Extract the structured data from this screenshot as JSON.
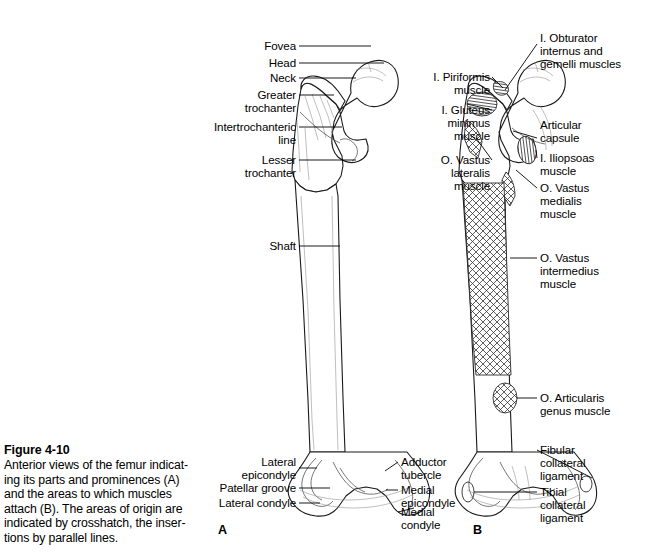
{
  "figure": {
    "number": "Figure 4-10",
    "caption_lines": [
      "Anterior views of the femur indicat-",
      "ing its parts and prominences (A)",
      "and the areas to which muscles",
      "attach (B). The areas of origin are",
      "indicated by crosshatch, the inser-",
      "tions by parallel lines."
    ],
    "caption_full": "Anterior views of the femur indicating its parts and prominences (A) and the areas to which muscles attach (B). The areas of origin are indicated by crosshatch, the insertions by parallel lines.",
    "panel_a_letter": "A",
    "panel_b_letter": "B",
    "subject": "femur",
    "view": "anterior"
  },
  "panel_a": {
    "title": "Anterior view of the femur — parts and prominences",
    "labels": [
      {
        "id": "fovea",
        "text": "Fovea",
        "side": "left"
      },
      {
        "id": "head",
        "text": "Head",
        "side": "left"
      },
      {
        "id": "neck",
        "text": "Neck",
        "side": "left"
      },
      {
        "id": "greater-trochanter",
        "text": "Greater\ntrochanter",
        "side": "left"
      },
      {
        "id": "intertrochanteric-line",
        "text": "Intertrochanteric\nline",
        "side": "left"
      },
      {
        "id": "lesser-trochanter",
        "text": "Lesser\ntrochanter",
        "side": "left"
      },
      {
        "id": "shaft",
        "text": "Shaft",
        "side": "left"
      },
      {
        "id": "lateral-epicondyle",
        "text": "Lateral\nepicondyle",
        "side": "left"
      },
      {
        "id": "patellar-groove",
        "text": "Patellar groove",
        "side": "left"
      },
      {
        "id": "lateral-condyle",
        "text": "Lateral condyle",
        "side": "left"
      },
      {
        "id": "adductor-tubercle",
        "text": "Adductor\ntubercle",
        "side": "right"
      },
      {
        "id": "medial-epicondyle",
        "text": "Medial\nepicondyle",
        "side": "right"
      },
      {
        "id": "medial-condyle",
        "text": "Medial\ncondyle",
        "side": "right"
      }
    ]
  },
  "panel_b": {
    "title": "Anterior view of the femur — muscle attachment areas",
    "legend": {
      "origin_marker": "crosshatch",
      "insertion_marker": "parallel lines",
      "origin_prefix": "O.",
      "insertion_prefix": "I."
    },
    "labels": [
      {
        "id": "obturator-internus-gemelli",
        "text": "I. Obturator\ninternus and\ngemelli muscles",
        "side": "right",
        "attachment": "insertion"
      },
      {
        "id": "piriformis",
        "text": "I. Piriformis\nmuscle",
        "side": "left",
        "attachment": "insertion"
      },
      {
        "id": "gluteus-minimus",
        "text": "I. Gluteus\nminimus\nmuscle",
        "side": "left",
        "attachment": "insertion"
      },
      {
        "id": "vastus-lateralis",
        "text": "O. Vastus\nlateralis\nmuscle",
        "side": "left",
        "attachment": "origin"
      },
      {
        "id": "articular-capsule",
        "text": "Articular\ncapsule",
        "side": "right",
        "attachment": "none"
      },
      {
        "id": "iliopsoas",
        "text": "I. Iliopsoas\nmuscle",
        "side": "right",
        "attachment": "insertion"
      },
      {
        "id": "vastus-medialis",
        "text": "O. Vastus\nmedialis\nmuscle",
        "side": "right",
        "attachment": "origin"
      },
      {
        "id": "vastus-intermedius",
        "text": "O. Vastus\nintermedius\nmuscle",
        "side": "right",
        "attachment": "origin"
      },
      {
        "id": "articularis-genus",
        "text": "O. Articularis\ngenus muscle",
        "side": "right",
        "attachment": "origin"
      },
      {
        "id": "fibular-collateral",
        "text": "Fibular\ncollateral\nligament",
        "side": "right",
        "attachment": "ligament"
      },
      {
        "id": "tibial-collateral",
        "text": "Tibial\ncollateral\nligament",
        "side": "right",
        "attachment": "ligament"
      }
    ]
  },
  "colors": {
    "background": "#ffffff",
    "ink": "#000000",
    "outline": "#1a1a1a",
    "shading": "#4a4a4a",
    "faint": "#8a8a8a"
  }
}
